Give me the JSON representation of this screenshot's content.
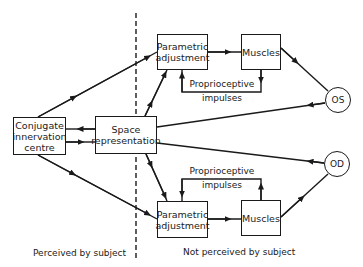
{
  "diagram": {
    "nodes": {
      "conjugate": "Conjugate innervation centre",
      "space": "Space representation",
      "param_upper": "Parametric adjustment",
      "muscles_upper": "Muscles",
      "param_lower": "Parametric adjustment",
      "muscles_lower": "Muscles",
      "os": "OS",
      "od": "OD"
    },
    "conjugate_lines": [
      "Conjugate",
      "innervation",
      "centre"
    ],
    "space_lines": [
      "Space",
      "representation"
    ],
    "param_lines": [
      "Parametric",
      "adjustment"
    ],
    "feedback_upper": [
      "Proprioceptive",
      "impulses"
    ],
    "feedback_lower": [
      "Proprioceptive",
      "impulses"
    ],
    "region_left": "Perceived by subject",
    "region_right": "Not perceived by subject"
  }
}
